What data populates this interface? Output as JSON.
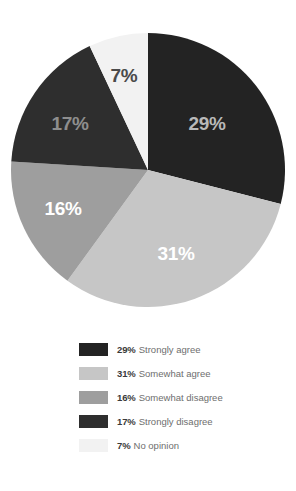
{
  "chart_data": {
    "type": "pie",
    "title": "",
    "categories": [
      "Strongly agree",
      "Somewhat agree",
      "Somewhat disagree",
      "Strongly disagree",
      "No opinion"
    ],
    "values": [
      29,
      31,
      16,
      17,
      7
    ],
    "value_unit": "%",
    "start_angle_deg": 0,
    "direction": "clockwise",
    "legend_position": "bottom",
    "grid": false,
    "slices": [
      {
        "label": "Strongly agree",
        "value": 29,
        "display": "29%",
        "color": "#232323",
        "label_color": "#b9b9b9",
        "label_x": 207,
        "label_y": 125
      },
      {
        "label": "Somewhat agree",
        "value": 31,
        "display": "31%",
        "color": "#c6c6c6",
        "label_color": "#ffffff",
        "label_x": 176,
        "label_y": 255
      },
      {
        "label": "Somewhat disagree",
        "value": 16,
        "display": "16%",
        "color": "#9e9e9e",
        "label_color": "#ffffff",
        "label_x": 63,
        "label_y": 210
      },
      {
        "label": "Strongly disagree",
        "value": 17,
        "display": "17%",
        "color": "#2e2e2e",
        "label_color": "#8e8e8e",
        "label_x": 70,
        "label_y": 125
      },
      {
        "label": "No opinion",
        "value": 7,
        "display": "7%",
        "color": "#f2f2f2",
        "label_color": "#4a4a4a",
        "label_x": 124,
        "label_y": 77
      }
    ]
  },
  "pie": {
    "center_x": 148,
    "center_y": 170,
    "radius": 137
  },
  "legend": {
    "items": [
      {
        "percent": "29%",
        "label": "Strongly agree",
        "color": "#232323"
      },
      {
        "percent": "31%",
        "label": "Somewhat agree",
        "color": "#c6c6c6"
      },
      {
        "percent": "16%",
        "label": "Somewhat disagree",
        "color": "#9e9e9e"
      },
      {
        "percent": "17%",
        "label": "Strongly disagree",
        "color": "#2e2e2e"
      },
      {
        "percent": "7%",
        "label": "No opinion",
        "color": "#f2f2f2"
      }
    ]
  }
}
